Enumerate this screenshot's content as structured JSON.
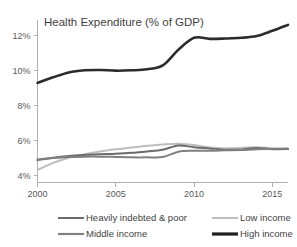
{
  "chart_data": {
    "type": "line",
    "title": "Health Expenditure (% of GDP)",
    "xlabel": "",
    "ylabel": "",
    "grid": false,
    "legend_position": "bottom",
    "xlim": [
      2000,
      2016
    ],
    "ylim": [
      3.6,
      12.9
    ],
    "x_ticks": [
      2000,
      2005,
      2010,
      2015
    ],
    "x_tick_labels": [
      "2000",
      "2005",
      "2010",
      "2015"
    ],
    "y_ticks": [
      4,
      6,
      8,
      10,
      12
    ],
    "y_tick_labels": [
      "4%",
      "6%",
      "8%",
      "10%",
      "12%"
    ],
    "x": [
      2000,
      2001,
      2002,
      2003,
      2004,
      2005,
      2006,
      2007,
      2008,
      2009,
      2010,
      2011,
      2012,
      2013,
      2014,
      2015,
      2016
    ],
    "series": [
      {
        "name": "Heavily indebted & poor",
        "color": "#6b6b6b",
        "width": 2.0,
        "values": [
          4.88,
          5.02,
          5.12,
          5.18,
          5.22,
          5.25,
          5.3,
          5.38,
          5.48,
          5.72,
          5.62,
          5.55,
          5.48,
          5.48,
          5.58,
          5.5,
          5.52
        ]
      },
      {
        "name": "Low income",
        "color": "#bdbdbd",
        "width": 2.0,
        "values": [
          4.32,
          4.72,
          5.02,
          5.22,
          5.38,
          5.5,
          5.6,
          5.7,
          5.78,
          5.82,
          5.74,
          5.6,
          5.55,
          5.58,
          5.62,
          5.56,
          5.52
        ]
      },
      {
        "name": "Middle income",
        "color": "#808080",
        "width": 2.0,
        "values": [
          4.92,
          5.0,
          5.06,
          5.08,
          5.08,
          5.06,
          5.04,
          5.04,
          5.06,
          5.36,
          5.42,
          5.42,
          5.44,
          5.46,
          5.5,
          5.52,
          5.54
        ]
      },
      {
        "name": "High income",
        "color": "#2b2b2b",
        "width": 2.6,
        "values": [
          9.3,
          9.62,
          9.9,
          10.02,
          10.04,
          10.0,
          10.02,
          10.08,
          10.3,
          11.2,
          11.88,
          11.82,
          11.84,
          11.88,
          11.98,
          12.28,
          12.62
        ]
      }
    ]
  },
  "legend": {
    "entries": [
      {
        "label": "Heavily indebted & poor",
        "color": "#6b6b6b",
        "width": 2.0
      },
      {
        "label": "Low income",
        "color": "#bdbdbd",
        "width": 2.0
      },
      {
        "label": "Middle income",
        "color": "#808080",
        "width": 2.2
      },
      {
        "label": "High income",
        "color": "#1f1f1f",
        "width": 3.2
      }
    ]
  }
}
